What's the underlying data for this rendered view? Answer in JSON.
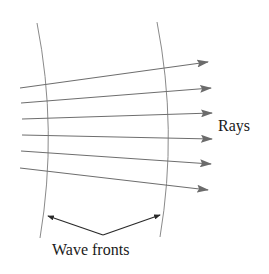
{
  "diagram": {
    "labels": {
      "rays": "Rays",
      "wave_fronts": "Wave fronts"
    },
    "colors": {
      "ray": "#6e6e6e",
      "arrowhead": "#6b6b6b",
      "wavefront": "#8a8a8a",
      "pointer": "#2a2a2a",
      "text": "#1a1a1a",
      "background": "#ffffff"
    },
    "rays": [
      {
        "x1": 20,
        "y1": 88,
        "x2": 208,
        "y2": 62
      },
      {
        "x1": 21,
        "y1": 103,
        "x2": 211,
        "y2": 88
      },
      {
        "x1": 22,
        "y1": 119,
        "x2": 212,
        "y2": 113
      },
      {
        "x1": 22,
        "y1": 135,
        "x2": 212,
        "y2": 139
      },
      {
        "x1": 21,
        "y1": 151,
        "x2": 211,
        "y2": 164
      },
      {
        "x1": 20,
        "y1": 168,
        "x2": 208,
        "y2": 190
      }
    ],
    "wavefronts": [
      {
        "name": "left",
        "path": "M37,23 Q58,130 40,238"
      },
      {
        "name": "right",
        "path": "M157,22 Q178,130 160,237"
      }
    ]
  }
}
